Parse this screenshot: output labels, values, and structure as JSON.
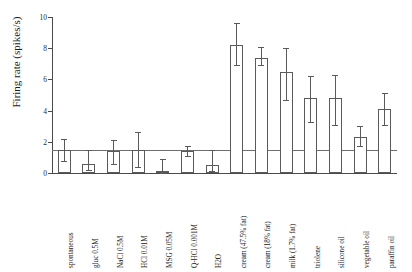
{
  "chart_data": {
    "type": "bar",
    "title": "",
    "xlabel": "",
    "ylabel": "Firing rate (spikes/s)",
    "ylim": [
      0,
      10
    ],
    "yticks": [
      0,
      2,
      4,
      6,
      8,
      10
    ],
    "ytick_labels": [
      "0",
      "2",
      "4",
      "6",
      "8",
      "10"
    ],
    "grid": false,
    "legend": "none",
    "reference_line": 1.5,
    "error_type": "error bars (SEM)",
    "categories": [
      "spontaneous",
      "gluc 0.5M",
      "NaCl 0.5M",
      "HCl 0.01M",
      "MSG 0.05M",
      "Q-HCl 0.001M",
      "H2O",
      "cream (47.5% fat)",
      "cream (18% fat)",
      "milk (1.7% fat)",
      "triolene",
      "silicone oil",
      "vegetable oil",
      "paraffin oil"
    ],
    "values": [
      1.5,
      0.6,
      1.4,
      1.5,
      0.15,
      1.4,
      0.5,
      8.2,
      7.4,
      6.5,
      4.8,
      4.8,
      2.3,
      4.1
    ],
    "err_low": [
      0.8,
      0.2,
      0.6,
      0.4,
      0.0,
      1.1,
      0.1,
      6.9,
      6.9,
      4.7,
      3.3,
      3.1,
      1.7,
      3.1
    ],
    "err_high": [
      2.2,
      1.5,
      2.1,
      2.6,
      0.9,
      1.7,
      1.5,
      9.6,
      8.1,
      8.0,
      6.2,
      6.3,
      3.0,
      5.1
    ]
  },
  "axis": {
    "y_title": "Firing rate (spikes/s)"
  }
}
